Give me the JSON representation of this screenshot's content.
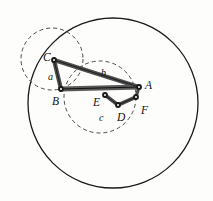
{
  "figure": {
    "background_color": "#fdfdfc",
    "stroke_color": "#1a1a1a",
    "link_fill_color": "#555555",
    "joint_color": "#1a1a1a"
  },
  "circles": [
    {
      "name": "large-solid-circle",
      "style": "solid",
      "cx": 113,
      "cy": 103,
      "r": 85,
      "stroke": "#1a1a1a",
      "stroke_width": 1.3
    },
    {
      "name": "upper-left-dashed-circle",
      "style": "dashed",
      "cx": 52,
      "cy": 59,
      "r": 31,
      "stroke": "#4a4a4a",
      "stroke_width": 1
    },
    {
      "name": "center-dashed-circle",
      "style": "dashed",
      "cx": 100,
      "cy": 97,
      "r": 36,
      "stroke": "#4a4a4a",
      "stroke_width": 1
    }
  ],
  "joints": [
    {
      "id": "C",
      "x": 54,
      "y": 60
    },
    {
      "id": "B",
      "x": 61,
      "y": 89
    },
    {
      "id": "A",
      "x": 139,
      "y": 87
    },
    {
      "id": "E",
      "x": 105,
      "y": 95
    },
    {
      "id": "D",
      "x": 118,
      "y": 105
    },
    {
      "id": "F",
      "x": 136,
      "y": 97
    }
  ],
  "links": [
    {
      "name": "link-C-B",
      "from": "C",
      "to": "B"
    },
    {
      "name": "link-C-A",
      "from": "C",
      "to": "A"
    },
    {
      "name": "link-B-A",
      "from": "B",
      "to": "A"
    },
    {
      "name": "link-E-D",
      "from": "E",
      "to": "D"
    },
    {
      "name": "link-D-F",
      "from": "D",
      "to": "F"
    },
    {
      "name": "link-A-F",
      "from": "A",
      "to": "F"
    }
  ],
  "point_labels": [
    {
      "text": "C",
      "x": 43,
      "y": 52
    },
    {
      "text": "B",
      "x": 52,
      "y": 96
    },
    {
      "text": "A",
      "x": 145,
      "y": 80
    },
    {
      "text": "E",
      "x": 93,
      "y": 97
    },
    {
      "text": "D",
      "x": 117,
      "y": 112
    },
    {
      "text": "F",
      "x": 141,
      "y": 105
    }
  ],
  "link_labels": [
    {
      "text": "a",
      "x": 48,
      "y": 72
    },
    {
      "text": "b",
      "x": 101,
      "y": 68
    },
    {
      "text": "c",
      "x": 99,
      "y": 113
    }
  ]
}
